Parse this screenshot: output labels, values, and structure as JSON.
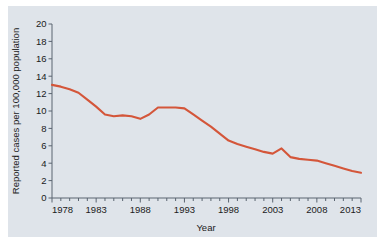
{
  "chart_data": {
    "type": "line",
    "title": "",
    "xlabel": "Year",
    "ylabel": "Reported cases per 100,000 population",
    "xlim": [
      1978,
      2013
    ],
    "ylim": [
      0,
      20
    ],
    "grid": false,
    "legend": null,
    "x_major_ticks": [
      1978,
      1983,
      1988,
      1993,
      1998,
      2003,
      2008,
      2013
    ],
    "x_tick_labels": [
      "1978",
      "1983",
      "1988",
      "1993",
      "1998",
      "2003",
      "2008",
      "2013"
    ],
    "x_minor_tick_step": 1,
    "y_major_ticks": [
      0,
      2,
      4,
      6,
      8,
      10,
      12,
      14,
      16,
      18,
      20
    ],
    "y_tick_labels": [
      "0",
      "2",
      "4",
      "6",
      "8",
      "10",
      "12",
      "14",
      "16",
      "18",
      "20"
    ],
    "series": [
      {
        "name": "Reported cases per 100,000 population",
        "color": "#d4563a",
        "x": [
          1978,
          1979,
          1980,
          1981,
          1982,
          1983,
          1984,
          1985,
          1986,
          1987,
          1988,
          1989,
          1990,
          1991,
          1992,
          1993,
          1994,
          1995,
          1996,
          1997,
          1998,
          1999,
          2000,
          2001,
          2002,
          2003,
          2004,
          2005,
          2006,
          2007,
          2008,
          2009,
          2010,
          2011,
          2012,
          2013
        ],
        "values": [
          13.0,
          12.8,
          12.5,
          12.1,
          11.3,
          10.5,
          9.6,
          9.4,
          9.5,
          9.4,
          9.1,
          9.6,
          10.4,
          10.4,
          10.4,
          10.3,
          9.6,
          8.9,
          8.2,
          7.4,
          6.6,
          6.2,
          5.9,
          5.6,
          5.3,
          5.1,
          5.7,
          4.7,
          4.5,
          4.4,
          4.3,
          4.0,
          3.7,
          3.4,
          3.1,
          2.9
        ]
      }
    ],
    "colors": {
      "line": "#d4563a",
      "panel_background": "#dfe4ea",
      "figure_background": "#ffffff",
      "axis": "#5a6470",
      "text": "#1b1b1b"
    }
  }
}
